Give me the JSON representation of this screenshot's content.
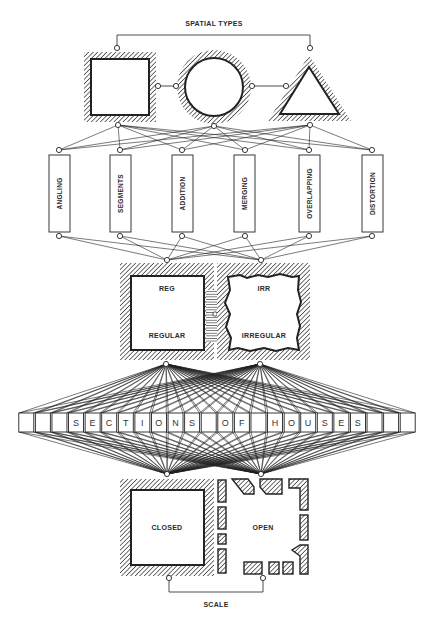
{
  "diagram": {
    "top_title": "SPATIAL TYPES",
    "bottom_title": "SCALE",
    "shapes": [
      {
        "id": "square",
        "label": ""
      },
      {
        "id": "circle",
        "label": ""
      },
      {
        "id": "triangle",
        "label": ""
      }
    ],
    "operations": [
      {
        "label": "ANGLING"
      },
      {
        "label": "SEGMENTS"
      },
      {
        "label": "ADDITION"
      },
      {
        "label": "MERGING"
      },
      {
        "label": "OVERLAPPING"
      },
      {
        "label": "DISTORTION"
      }
    ],
    "regularity": [
      {
        "abbr": "REG",
        "label": "REGULAR"
      },
      {
        "abbr": "IRR",
        "label": "IRREGULAR"
      }
    ],
    "sections_row": {
      "cells": [
        "",
        "",
        "",
        "S",
        "E",
        "C",
        "T",
        "I",
        "O",
        "N",
        "S",
        "",
        "O",
        "F",
        "",
        "H",
        "O",
        "U",
        "S",
        "E",
        "S",
        "",
        "",
        ""
      ]
    },
    "enclosure": [
      {
        "label": "CLOSED"
      },
      {
        "label": "OPEN"
      }
    ],
    "colors": {
      "ink": "#222222",
      "paper": "#ffffff"
    }
  }
}
